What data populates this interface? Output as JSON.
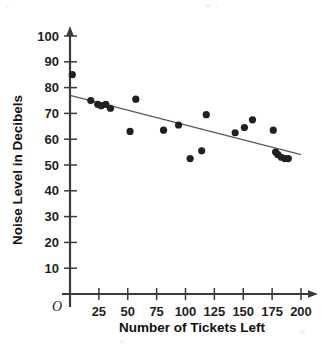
{
  "chart_data": {
    "type": "scatter",
    "title": "",
    "xlabel": "Number of Tickets Left",
    "ylabel": "Noise Level in Decibels",
    "xlim": [
      0,
      210
    ],
    "ylim": [
      0,
      105
    ],
    "grid": false,
    "legend": false,
    "origin_label": "O",
    "x_ticks": [
      25,
      50,
      75,
      100,
      125,
      150,
      175,
      200
    ],
    "y_ticks": [
      10,
      20,
      30,
      40,
      50,
      60,
      70,
      80,
      90,
      100
    ],
    "x_tick_labels": [
      "25",
      "50",
      "75",
      "100",
      "125",
      "150",
      "175",
      "200"
    ],
    "y_tick_labels": [
      "10",
      "20",
      "30",
      "40",
      "50",
      "60",
      "70",
      "80",
      "90",
      "100"
    ],
    "points": [
      {
        "x": 2,
        "y": 85
      },
      {
        "x": 18,
        "y": 75
      },
      {
        "x": 24,
        "y": 73.5
      },
      {
        "x": 27,
        "y": 73
      },
      {
        "x": 31,
        "y": 73.5
      },
      {
        "x": 35,
        "y": 72
      },
      {
        "x": 52,
        "y": 63
      },
      {
        "x": 57,
        "y": 75.5
      },
      {
        "x": 81,
        "y": 63.5
      },
      {
        "x": 94,
        "y": 65.5
      },
      {
        "x": 104,
        "y": 52.5
      },
      {
        "x": 114,
        "y": 55.5
      },
      {
        "x": 118,
        "y": 69.5
      },
      {
        "x": 143,
        "y": 62.5
      },
      {
        "x": 151,
        "y": 64.5
      },
      {
        "x": 158,
        "y": 67.5
      },
      {
        "x": 176,
        "y": 63.5
      },
      {
        "x": 178,
        "y": 55
      },
      {
        "x": 180,
        "y": 54
      },
      {
        "x": 183,
        "y": 53
      },
      {
        "x": 186,
        "y": 52.5
      },
      {
        "x": 189,
        "y": 52.5
      }
    ],
    "trend_line": {
      "x_start": 0,
      "y_start": 77,
      "x_end": 200,
      "y_end": 54
    },
    "series": [
      {
        "name": "Noise Level vs Tickets Left",
        "x": [
          2,
          18,
          24,
          27,
          31,
          35,
          52,
          57,
          81,
          94,
          104,
          114,
          118,
          143,
          151,
          158,
          176,
          178,
          180,
          183,
          186,
          189
        ],
        "values": [
          85,
          75,
          73.5,
          73,
          73.5,
          72,
          63,
          75.5,
          63.5,
          65.5,
          52.5,
          55.5,
          69.5,
          62.5,
          64.5,
          67.5,
          63.5,
          55,
          54,
          53,
          52.5,
          52.5
        ]
      }
    ],
    "colors": {
      "point": "#231f20",
      "axis": "#3b3b3b",
      "trend": "#5a5a5a",
      "text": "#111111",
      "background": "#ffffff"
    }
  }
}
